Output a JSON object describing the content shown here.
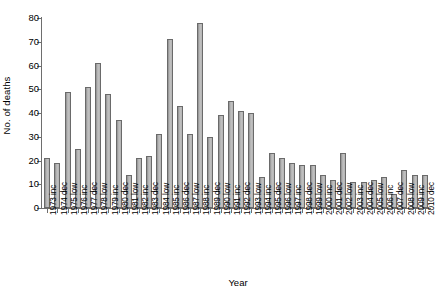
{
  "chart_data": {
    "type": "bar",
    "title": "",
    "xlabel": "Year",
    "ylabel": "No. of deaths",
    "ylim": [
      0,
      80
    ],
    "yticks": [
      0,
      10,
      20,
      30,
      40,
      50,
      60,
      70,
      80
    ],
    "grid": false,
    "legend": null,
    "bar_color": "#b9b9b9",
    "bar_edge_color": "#6a6a6a",
    "axis_color": "#6e6e6e",
    "categories": [
      "1973 inc",
      "1974 dec",
      "1975 low",
      "1976 inc",
      "1977 dec",
      "1978 low",
      "1979 inc",
      "1980 dec",
      "1981 low",
      "1982 inc",
      "1983 dec",
      "1984 low",
      "1985 inc",
      "1986 dec",
      "1987 low",
      "1988 inc",
      "1989 dec",
      "1990 low",
      "1991 inc",
      "1992 dec",
      "1993 low",
      "1994 inc",
      "1995 dec",
      "1996 low",
      "1997 inc",
      "1998 dec",
      "1999 low",
      "2000 inc",
      "2001 dec",
      "2002 low",
      "2003 inc",
      "2004 dec",
      "2005 low",
      "2006 inc",
      "2007 dec",
      "2008 low",
      "2009 inc",
      "2010 dec"
    ],
    "values": [
      21,
      19,
      49,
      25,
      51,
      61,
      48,
      37,
      14,
      21,
      22,
      31,
      71,
      43,
      31,
      78,
      30,
      39,
      45,
      41,
      40,
      13,
      23,
      21,
      19,
      18,
      18,
      14,
      12,
      23,
      11,
      11,
      12,
      13,
      6,
      16,
      14,
      14
    ]
  }
}
